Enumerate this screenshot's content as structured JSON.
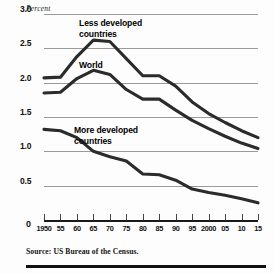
{
  "chart_data": {
    "type": "line",
    "title": "",
    "xlabel": "",
    "ylabel": "Percent",
    "ylim": [
      0,
      3.0
    ],
    "xlim": [
      1950,
      2015
    ],
    "grid": true,
    "legend_position": "inline-annotations",
    "yticks": [
      "0",
      "0.5",
      "1.0",
      "1.5",
      "2.0",
      "2.5",
      "3.0"
    ],
    "ytick_values": [
      0,
      0.5,
      1.0,
      1.5,
      2.0,
      2.5,
      3.0
    ],
    "xticks": [
      "1950",
      "55",
      "60",
      "65",
      "70",
      "75",
      "80",
      "85",
      "90",
      "95",
      "2000",
      "05",
      "10",
      "15"
    ],
    "xtick_values": [
      1950,
      1955,
      1960,
      1965,
      1970,
      1975,
      1980,
      1985,
      1990,
      1995,
      2000,
      2005,
      2010,
      2015
    ],
    "x": [
      1950,
      1955,
      1960,
      1965,
      1970,
      1975,
      1980,
      1985,
      1990,
      1995,
      2000,
      2005,
      2010,
      2015
    ],
    "series": [
      {
        "name": "Less developed countries",
        "values": [
          2.07,
          2.08,
          2.38,
          2.62,
          2.6,
          2.35,
          2.1,
          2.1,
          1.95,
          1.72,
          1.55,
          1.42,
          1.3,
          1.2
        ]
      },
      {
        "name": "World",
        "values": [
          1.85,
          1.86,
          2.06,
          2.18,
          2.12,
          1.9,
          1.76,
          1.76,
          1.6,
          1.45,
          1.33,
          1.22,
          1.12,
          1.04
        ]
      },
      {
        "name": "More developed countries",
        "values": [
          1.32,
          1.3,
          1.2,
          1.0,
          0.92,
          0.86,
          0.67,
          0.66,
          0.58,
          0.45,
          0.4,
          0.36,
          0.31,
          0.25
        ]
      }
    ],
    "annotations": [
      {
        "text_line1": "Less developed",
        "text_line2": "countries"
      },
      {
        "text_line1": "World",
        "text_line2": ""
      },
      {
        "text_line1": "More developed",
        "text_line2": "countries"
      }
    ]
  },
  "axis_unit_label": "Percent",
  "zero_label": "0",
  "source": {
    "text": "Source: US Bureau of the Census."
  },
  "colors": {
    "line": "#2b2b2b",
    "grid": "#9a9a9a",
    "axis": "#1a1a1a",
    "text": "#111111"
  }
}
